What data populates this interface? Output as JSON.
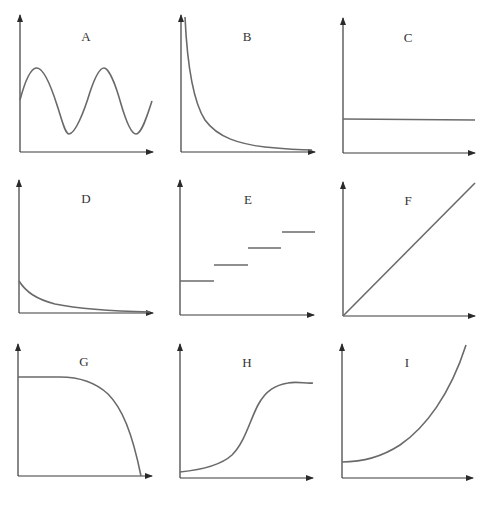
{
  "colors": {
    "axis": "#3a3a3a",
    "curve": "#6a6a6a",
    "background": "#ffffff"
  },
  "panels": [
    {
      "id": "A",
      "label": "A",
      "shape": "sine wave"
    },
    {
      "id": "B",
      "label": "B",
      "shape": "steep decay (1/x)"
    },
    {
      "id": "C",
      "label": "C",
      "shape": "constant horizontal line"
    },
    {
      "id": "D",
      "label": "D",
      "shape": "exponential decay"
    },
    {
      "id": "E",
      "label": "E",
      "shape": "step function"
    },
    {
      "id": "F",
      "label": "F",
      "shape": "linear increase through origin"
    },
    {
      "id": "G",
      "label": "G",
      "shape": "flat then accelerating decline"
    },
    {
      "id": "H",
      "label": "H",
      "shape": "sigmoid (S-curve)"
    },
    {
      "id": "I",
      "label": "I",
      "shape": "accelerating increase (quadratic)"
    }
  ]
}
